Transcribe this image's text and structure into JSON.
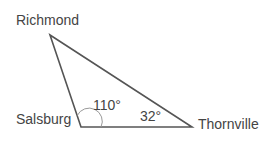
{
  "diagram": {
    "type": "triangle",
    "vertices": {
      "richmond": {
        "label": "Richmond",
        "x": 50,
        "y": 35
      },
      "salsburg": {
        "label": "Salsburg",
        "x": 81,
        "y": 127
      },
      "thornville": {
        "label": "Thornville",
        "x": 192,
        "y": 127
      }
    },
    "angles": {
      "salsburg": "110°",
      "thornville": "32°"
    },
    "colors": {
      "line": "#555555",
      "arc": "#999999",
      "text": "#444444"
    }
  }
}
